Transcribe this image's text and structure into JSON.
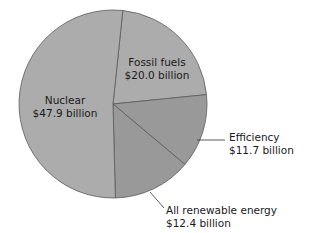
{
  "chart_data": {
    "type": "pie",
    "title": "",
    "unit": "$ billion",
    "start_angle_deg": 6,
    "direction": "clockwise",
    "slices": [
      {
        "name": "Fossil fuels",
        "value": 20.0,
        "label_line1": "Fossil fuels",
        "label_line2": "$20.0 billion",
        "color": "#acacac"
      },
      {
        "name": "Efficiency",
        "value": 11.7,
        "label_line1": "Efficiency",
        "label_line2": "$11.7 billion",
        "color": "#999999"
      },
      {
        "name": "All renewable energy",
        "value": 12.4,
        "label_line1": "All renewable energy",
        "label_line2": "$12.4 billion",
        "color": "#999999"
      },
      {
        "name": "Nuclear",
        "value": 47.9,
        "label_line1": "Nuclear",
        "label_line2": "$47.9 billion",
        "color": "#acacac"
      }
    ],
    "legend": "none (direct labels)"
  },
  "style": {
    "edge_color": "#5a5a5a",
    "leader_color": "#333333"
  }
}
